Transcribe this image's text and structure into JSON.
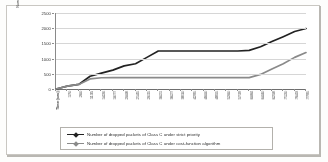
{
  "chart_data": {
    "type": "line",
    "title": "",
    "xlabel": "Time (sec)",
    "ylabel": "Number of dropped packets",
    "ylim": [
      0,
      2500
    ],
    "yticks": [
      0,
      500,
      1000,
      1500,
      2000,
      2500
    ],
    "ytick_labels": [
      "0",
      "500",
      "1000",
      "1500",
      "2000",
      "2500"
    ],
    "grid": true,
    "legend_position": "bottom",
    "x": [
      0,
      170,
      260,
      1135,
      1426,
      1677,
      2008,
      2145,
      2615,
      3021,
      3627,
      3810,
      4295,
      4600,
      4855,
      5260,
      5719,
      6084,
      6440,
      6258,
      7120,
      7643,
      7795
    ],
    "xtick_labels": [
      "Time (sec)",
      "170",
      "260",
      "1135",
      "1426",
      "1677",
      "2008",
      "2145",
      "2615",
      "3021",
      "3627",
      "3810",
      "4295",
      "4600",
      "4855",
      "5260",
      "5719",
      "6084",
      "6440",
      "6258",
      "7120",
      "7643",
      "7795"
    ],
    "series": [
      {
        "name": "Number of dropped packets of Class C under strict priority",
        "color": "#222222",
        "values": [
          0,
          95,
          150,
          420,
          520,
          620,
          760,
          830,
          1040,
          1250,
          1250,
          1250,
          1250,
          1250,
          1250,
          1250,
          1250,
          1270,
          1390,
          1560,
          1720,
          1890,
          1990
        ]
      },
      {
        "name": "Number of dropped packets of Class C under cost-function algorithm",
        "color": "#8a8a8a",
        "values": [
          0,
          95,
          150,
          330,
          370,
          375,
          375,
          375,
          375,
          375,
          375,
          375,
          375,
          375,
          375,
          375,
          375,
          375,
          480,
          660,
          830,
          1040,
          1200
        ]
      }
    ]
  },
  "legend": {
    "entries": [
      {
        "label": "Number of dropped packets of Class C under strict priority",
        "marker": "line-with-diamond-marker",
        "color": "#222222"
      },
      {
        "label": "Number of dropped packets of Class C under cost-function algorithm",
        "marker": "line-with-diamond-marker",
        "color": "#8a8a8a"
      }
    ]
  },
  "colors": {
    "series_strict_priority": "#222222",
    "series_cost_function": "#8a8a8a",
    "gridline": "#d6d6d6",
    "axis": "#6f6f6f",
    "frame": "#c9c7c2",
    "background": "#ffffff"
  }
}
